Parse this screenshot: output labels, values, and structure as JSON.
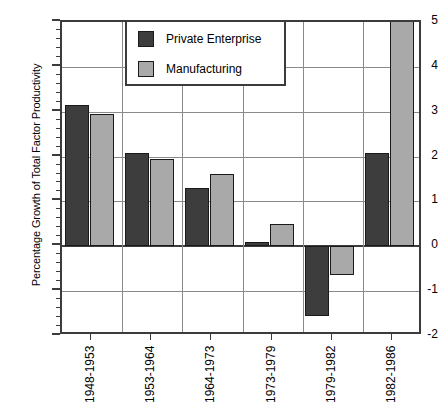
{
  "chart_data": {
    "type": "bar",
    "title": "",
    "xlabel": "",
    "ylabel": "Percentage Growth of Total Factor Productivity",
    "ylim": [
      -2,
      5
    ],
    "yticks": [
      -2,
      -1,
      0,
      1,
      2,
      3,
      4,
      5
    ],
    "ytick_labels": [
      "-2",
      "-1",
      "0",
      "1",
      "2",
      "3",
      "4",
      "5"
    ],
    "grid": true,
    "legend_position": "top-center",
    "categories": [
      "1948-1953",
      "1953-1964",
      "1964-1973",
      "1973-1979",
      "1979-1982",
      "1982-1986"
    ],
    "series": [
      {
        "name": "Private Enterprise",
        "color": "#3d3d3d",
        "values": [
          3.15,
          2.08,
          1.3,
          0.1,
          -1.55,
          2.08
        ]
      },
      {
        "name": "Manufacturing",
        "color": "#a9a9a9",
        "values": [
          2.95,
          1.95,
          1.62,
          0.5,
          -0.65,
          5.0
        ]
      }
    ]
  },
  "colors": {
    "series_private": "#3d3d3d",
    "series_manufacturing": "#a9a9a9",
    "axis": "#3c3c3c",
    "gridline": "#8a8a8a",
    "background": "#ffffff"
  },
  "legend": {
    "items": [
      {
        "label": "Private Enterprise"
      },
      {
        "label": "Manufacturing"
      }
    ]
  }
}
